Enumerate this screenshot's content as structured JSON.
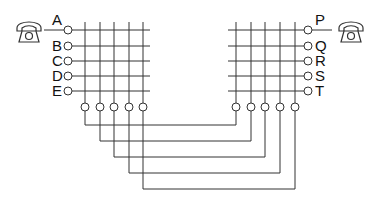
{
  "diagram": {
    "left_lines": [
      "A",
      "B",
      "C",
      "D",
      "E"
    ],
    "right_lines": [
      "P",
      "Q",
      "R",
      "S",
      "T"
    ],
    "left_phone": {
      "icon": "telephone-icon",
      "attached_to": "A"
    },
    "right_phone": {
      "icon": "telephone-icon",
      "attached_to": "P"
    },
    "trunks": 5,
    "colors": {
      "line": "#333333",
      "background": "#ffffff"
    }
  }
}
